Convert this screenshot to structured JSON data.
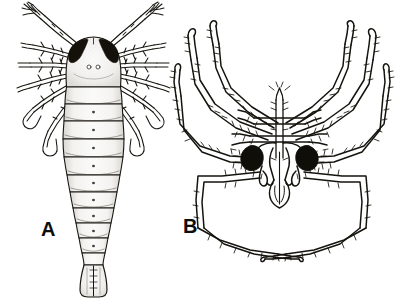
{
  "figure": {
    "type": "scientific-illustration-plate",
    "panel_count": 2,
    "background_color": "#ffffff",
    "ink_color": "#111111",
    "style": "black-and-white line drawing with stipple shading"
  },
  "labels": {
    "panel_a": "A",
    "panel_b": "B"
  },
  "panel_a": {
    "label": "A",
    "subject": "elongate segmented arthropod, dorsal view",
    "orientation": "anterior up, posterior down",
    "features": {
      "antennae": "paired, long, jointed, forked distal tips, directed antero-laterally",
      "eyes": "paired dark pigmented compound eye patches on anterolateral head margin",
      "ocelli": "two small median dots on head shield",
      "appendages": "multiple pairs of jointed setose legs radiating laterally from cephalothorax",
      "body": "segmented trunk with curved transverse segment boundaries and faint midline",
      "segment_count": 11,
      "telson": "terminal flared tail plate with median suture"
    },
    "shading": "light grey stipple fill",
    "eye_color": "#111111",
    "fill_color": "#f2f2f0"
  },
  "panel_b": {
    "label": "B",
    "subject": "sea spider (pycnogonid-like arachnomorph), dorsal view",
    "orientation": "anterior up, posterior down",
    "features": {
      "eyes": "two large black ocular patches flanking the midline",
      "proboscis": "median anterior proboscis / rostrum with paired chelicerae below",
      "palps": "paired short palps lateral to proboscis",
      "legs": "four pairs of long, angular, heavily spined walking legs",
      "leg_pairs": 4,
      "spines": "dense short setae along all leg segments",
      "tarsi": "pointed recurved terminal claws"
    },
    "eye_color": "#111111",
    "fill_color": "#ffffff"
  }
}
